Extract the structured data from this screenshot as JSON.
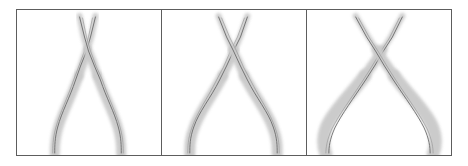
{
  "figure": {
    "kind": "image-sequence",
    "background_color": "#ffffff",
    "frame_color": "#5d5d5d",
    "frame_width_px": 1,
    "silhouette_color": "#c9c9c9",
    "contour_color": "#6a6a6a",
    "panel_count": 3,
    "panels": [
      {
        "id": "panel-1",
        "index": 1,
        "subject": "pliers",
        "state": "closed",
        "open_angle_degrees": 14,
        "handle_spread": "narrow",
        "jaw_spread": "narrow",
        "caption": ""
      },
      {
        "id": "panel-2",
        "index": 2,
        "subject": "pliers",
        "state": "partly-open",
        "open_angle_degrees": 24,
        "handle_spread": "medium",
        "jaw_spread": "medium",
        "caption": ""
      },
      {
        "id": "panel-3",
        "index": 3,
        "subject": "pliers",
        "state": "open",
        "open_angle_degrees": 40,
        "handle_spread": "wide",
        "jaw_spread": "wide",
        "caption": ""
      }
    ]
  }
}
